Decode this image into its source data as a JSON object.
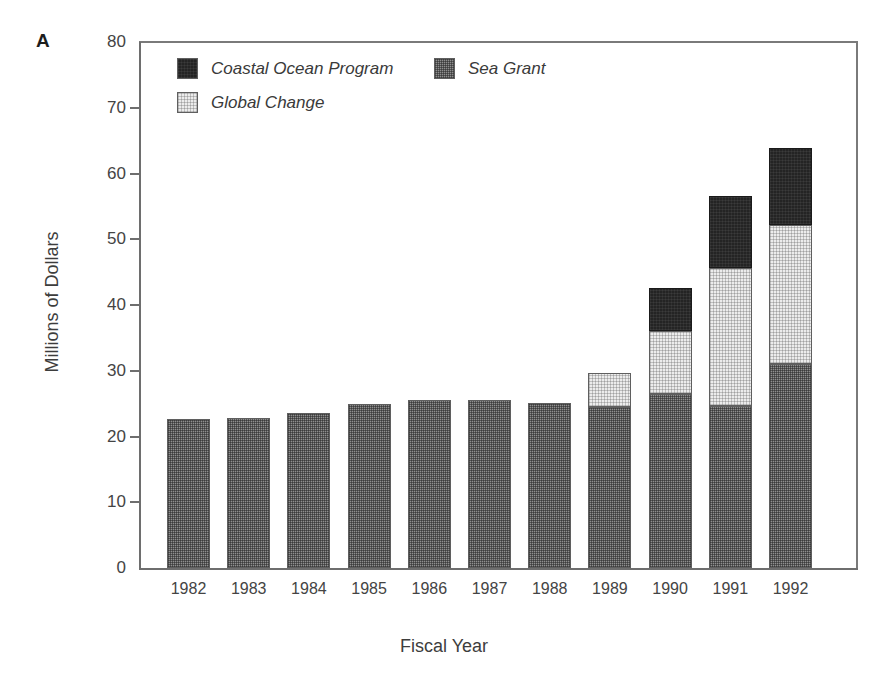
{
  "panel": {
    "letter": "A"
  },
  "axes": {
    "ylabel": "Millions of Dollars",
    "xlabel": "Fiscal Year",
    "yticks": [
      "0",
      "10",
      "20",
      "30",
      "40",
      "50",
      "60",
      "70",
      "80"
    ]
  },
  "legend": {
    "items": [
      {
        "label": "Coastal Ocean Program",
        "swatch": "coastal-ocean-swatch",
        "color": "#242424"
      },
      {
        "label": "Sea Grant",
        "swatch": "sea-grant-swatch",
        "color": "#8f8f8f"
      },
      {
        "label": "Global Change",
        "swatch": "global-change-swatch",
        "color": "#ececec"
      }
    ]
  },
  "chart_data": {
    "type": "bar",
    "title": "",
    "subtitle": "",
    "xlabel": "Fiscal Year",
    "ylabel": "Millions of Dollars",
    "ylim": [
      0,
      80
    ],
    "yticks": [
      0,
      10,
      20,
      30,
      40,
      50,
      60,
      70,
      80
    ],
    "grid": false,
    "stacked": true,
    "legend_position": "inside-top-left",
    "categories": [
      "1982",
      "1983",
      "1984",
      "1985",
      "1986",
      "1987",
      "1988",
      "1989",
      "1990",
      "1991",
      "1992"
    ],
    "series": [
      {
        "name": "Sea Grant",
        "color": "#8f8f8f",
        "values": [
          22.6,
          22.8,
          23.5,
          25.0,
          25.6,
          25.5,
          25.1,
          24.5,
          26.5,
          24.6,
          31.0
        ]
      },
      {
        "name": "Global Change",
        "color": "#ececec",
        "values": [
          0,
          0,
          0,
          0,
          0,
          0,
          0,
          5.2,
          9.5,
          21.0,
          21.2
        ]
      },
      {
        "name": "Coastal Ocean Program",
        "color": "#242424",
        "values": [
          0,
          0,
          0,
          0,
          0,
          0,
          0,
          0,
          6.6,
          11.0,
          11.7
        ]
      }
    ],
    "totals": [
      22.6,
      22.8,
      23.5,
      25.0,
      25.6,
      25.5,
      25.1,
      29.7,
      42.6,
      56.6,
      63.9
    ]
  }
}
